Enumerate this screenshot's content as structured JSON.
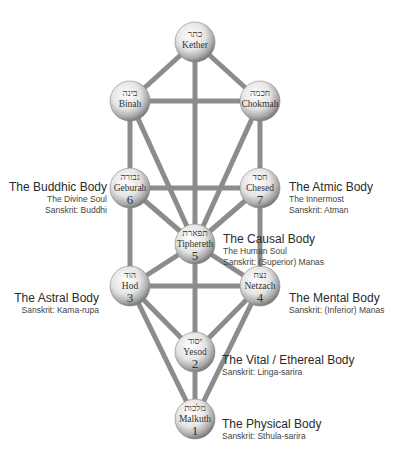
{
  "diagram": {
    "colors": {
      "path": "#8c8c8c",
      "sphere_light": "#ffffff",
      "sphere_dark": "#8a8a8a",
      "text": "#333333"
    },
    "nodes": [
      {
        "id": "kether",
        "hebrew": "כתר",
        "name": "Kether",
        "number": "",
        "x": 195,
        "y": 42
      },
      {
        "id": "binah",
        "hebrew": "בינה",
        "name": "Binah",
        "number": "",
        "x": 130,
        "y": 101
      },
      {
        "id": "chokmah",
        "hebrew": "חכמה",
        "name": "Chokmah",
        "number": "",
        "x": 260,
        "y": 101
      },
      {
        "id": "geburah",
        "hebrew": "גבורה",
        "name": "Geburah",
        "number": "6",
        "x": 130,
        "y": 188
      },
      {
        "id": "chesed",
        "hebrew": "חסד",
        "name": "Chesed",
        "number": "7",
        "x": 260,
        "y": 188
      },
      {
        "id": "tiphereth",
        "hebrew": "תפארת",
        "name": "Tiphereth",
        "number": "5",
        "x": 195,
        "y": 244
      },
      {
        "id": "hod",
        "hebrew": "הוד",
        "name": "Hod",
        "number": "3",
        "x": 130,
        "y": 286
      },
      {
        "id": "netzach",
        "hebrew": "נצח",
        "name": "Netzach",
        "number": "4",
        "x": 260,
        "y": 286
      },
      {
        "id": "yesod",
        "hebrew": "יסוד",
        "name": "Yesod",
        "number": "2",
        "x": 195,
        "y": 352
      },
      {
        "id": "malkuth",
        "hebrew": "מלכות",
        "name": "Malkuth",
        "number": "1",
        "x": 195,
        "y": 419
      }
    ],
    "paths": [
      [
        "kether",
        "binah"
      ],
      [
        "kether",
        "chokmah"
      ],
      [
        "kether",
        "tiphereth"
      ],
      [
        "binah",
        "chokmah"
      ],
      [
        "binah",
        "geburah"
      ],
      [
        "binah",
        "tiphereth"
      ],
      [
        "chokmah",
        "chesed"
      ],
      [
        "chokmah",
        "tiphereth"
      ],
      [
        "geburah",
        "chesed"
      ],
      [
        "geburah",
        "tiphereth"
      ],
      [
        "geburah",
        "hod"
      ],
      [
        "chesed",
        "tiphereth"
      ],
      [
        "chesed",
        "netzach"
      ],
      [
        "tiphereth",
        "hod"
      ],
      [
        "tiphereth",
        "netzach"
      ],
      [
        "tiphereth",
        "yesod"
      ],
      [
        "hod",
        "netzach"
      ],
      [
        "hod",
        "yesod"
      ],
      [
        "hod",
        "malkuth"
      ],
      [
        "netzach",
        "yesod"
      ],
      [
        "netzach",
        "malkuth"
      ],
      [
        "yesod",
        "malkuth"
      ]
    ],
    "labels": {
      "buddhic": {
        "title": "The Buddhic Body",
        "lines": [
          "The Divine Soul",
          "Sanskrit: Buddhi"
        ]
      },
      "atmic": {
        "title": "The Atmic Body",
        "lines": [
          "The Innermost",
          "Sanskrit: Atman"
        ]
      },
      "causal": {
        "title": "The Causal Body",
        "lines": [
          "The Human Soul",
          "Sanskrit: (Superior) Manas"
        ]
      },
      "astral": {
        "title": "The Astral Body",
        "lines": [
          "Sanskrit: Kama-rupa"
        ]
      },
      "mental": {
        "title": "The Mental Body",
        "lines": [
          "Sanskrit: (Inferior) Manas"
        ]
      },
      "vital": {
        "title": "The Vital / Ethereal Body",
        "lines": [
          "Sanskrit: Linga-sarira"
        ]
      },
      "physical": {
        "title": "The Physical Body",
        "lines": [
          "Sanskrit: Sthula-sarira"
        ]
      }
    }
  }
}
